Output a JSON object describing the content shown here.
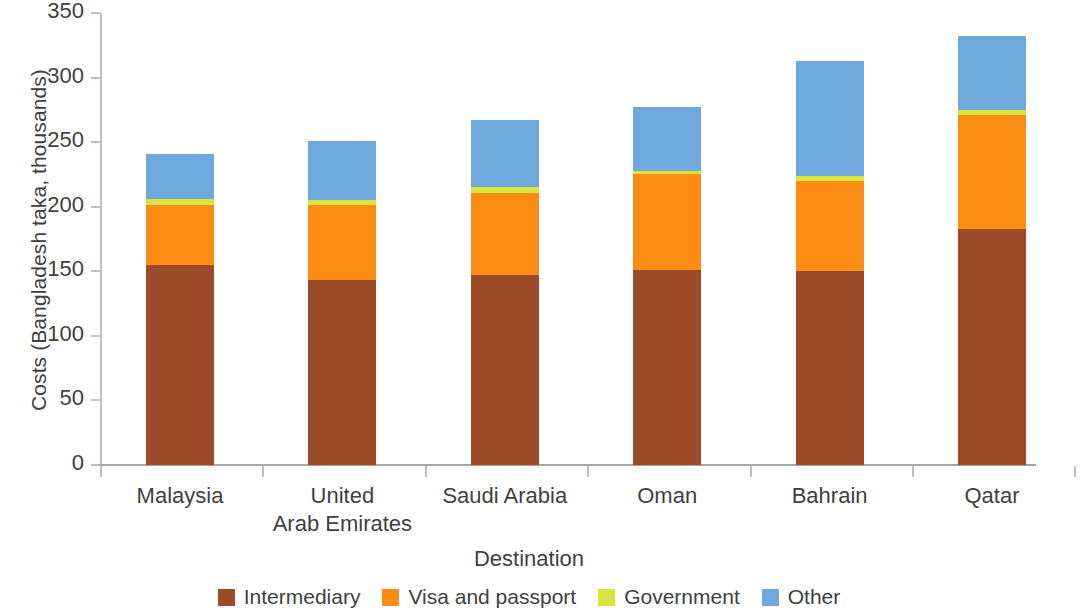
{
  "chart_data": {
    "type": "bar",
    "subtype": "stacked-bar",
    "title": "",
    "xlabel": "Destination",
    "ylabel": "Costs (Bangladesh taka, thousands)",
    "categories": [
      "Malaysia",
      "United Arab Emirates",
      "Saudi Arabia",
      "Oman",
      "Bahrain",
      "Qatar"
    ],
    "category_label_lines": [
      [
        "Malaysia"
      ],
      [
        "United",
        "Arab Emirates"
      ],
      [
        "Saudi Arabia"
      ],
      [
        "Oman"
      ],
      [
        "Bahrain"
      ],
      [
        "Qatar"
      ]
    ],
    "series": [
      {
        "name": "Intermediary",
        "color": "#9c4a27",
        "values": [
          155,
          143,
          147,
          151,
          150,
          183
        ]
      },
      {
        "name": "Visa and passport",
        "color": "#fb8c15",
        "values": [
          46,
          58,
          64,
          74,
          70,
          88
        ]
      },
      {
        "name": "Government",
        "color": "#dae43f",
        "values": [
          5,
          4,
          4,
          3,
          4,
          4
        ]
      },
      {
        "name": "Other",
        "color": "#6fa8dc",
        "values": [
          35,
          46,
          52,
          49,
          89,
          57
        ]
      }
    ],
    "totals": [
      240,
      251,
      267,
      277,
      313,
      332
    ],
    "ylim": [
      0,
      350
    ],
    "yticks": [
      0,
      50,
      100,
      150,
      200,
      250,
      300,
      350
    ],
    "ytick_labels": [
      "0",
      "50",
      "100",
      "150",
      "200",
      "250",
      "300",
      "350"
    ],
    "grid": false,
    "legend_position": "bottom"
  },
  "legend": {
    "items": [
      {
        "label": "Intermediary",
        "color": "#9c4a27"
      },
      {
        "label": "Visa and passport",
        "color": "#fb8c15"
      },
      {
        "label": "Government",
        "color": "#dae43f"
      },
      {
        "label": "Other",
        "color": "#6fa8dc"
      }
    ]
  },
  "axes": {
    "y_title": "Costs (Bangladesh taka, thousands)",
    "x_title": "Destination"
  },
  "colors": {
    "axis": "#bfbfbf",
    "baseline": "#a6a6a6",
    "text": "#3f3f3f",
    "background": "#ffffff"
  }
}
